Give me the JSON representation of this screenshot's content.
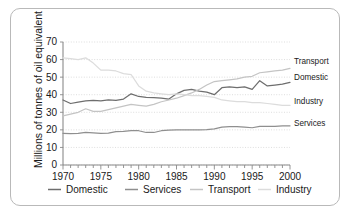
{
  "chart_data": {
    "type": "line",
    "title": "",
    "xlabel": "",
    "ylabel": "Millions of tonnes of oil equivalent",
    "xlim": [
      1970,
      2000
    ],
    "ylim": [
      0,
      70
    ],
    "grid": true,
    "legend_position": "bottom",
    "y_ticks": [
      "0",
      "10",
      "20",
      "30",
      "40",
      "50",
      "60",
      "70"
    ],
    "x_ticks_major": [
      "1970",
      "1975",
      "1980",
      "1985",
      "1990",
      "1995",
      "2000"
    ],
    "x_tick_interval_minor": 1,
    "x": [
      1970,
      1971,
      1972,
      1973,
      1974,
      1975,
      1976,
      1977,
      1978,
      1979,
      1980,
      1981,
      1982,
      1983,
      1984,
      1985,
      1986,
      1987,
      1988,
      1989,
      1990,
      1991,
      1992,
      1993,
      1994,
      1995,
      1996,
      1997,
      1998,
      1999,
      2000
    ],
    "series": [
      {
        "name": "Domestic",
        "color": "#6e6e6e",
        "end_label": "Domestic",
        "values": [
          37.0,
          35.0,
          35.8,
          36.5,
          36.8,
          36.5,
          37.0,
          36.8,
          37.5,
          40.5,
          39.0,
          38.5,
          38.3,
          38.0,
          37.5,
          40.5,
          42.5,
          43.0,
          42.0,
          41.5,
          40.0,
          44.0,
          44.5,
          44.0,
          44.5,
          43.0,
          48.0,
          45.0,
          45.5,
          46.0,
          47.0
        ]
      },
      {
        "name": "Services",
        "color": "#8f8f8f",
        "end_label": "Services",
        "values": [
          18.0,
          17.8,
          18.0,
          18.5,
          18.3,
          18.0,
          18.2,
          19.0,
          19.2,
          19.5,
          19.5,
          18.5,
          18.5,
          19.5,
          19.8,
          20.0,
          20.0,
          20.0,
          20.0,
          20.2,
          20.5,
          21.5,
          21.8,
          21.8,
          21.5,
          21.2,
          22.0,
          22.0,
          22.0,
          22.2,
          22.3
        ]
      },
      {
        "name": "Transport",
        "color": "#c4c4c4",
        "end_label": "Transport",
        "values": [
          28.0,
          29.0,
          30.0,
          32.0,
          30.5,
          30.5,
          31.5,
          32.5,
          33.5,
          34.5,
          34.0,
          33.5,
          34.5,
          36.0,
          37.0,
          38.0,
          39.5,
          41.0,
          43.0,
          45.5,
          47.5,
          48.0,
          48.5,
          49.0,
          50.0,
          50.5,
          52.5,
          53.0,
          53.5,
          54.0,
          55.0
        ]
      },
      {
        "name": "Industry",
        "color": "#dcdcdc",
        "end_label": "Industry",
        "values": [
          61.0,
          60.5,
          60.0,
          61.0,
          58.0,
          54.0,
          54.0,
          53.5,
          52.0,
          51.5,
          45.0,
          42.0,
          41.0,
          40.5,
          40.0,
          40.5,
          40.0,
          39.5,
          39.5,
          39.0,
          38.5,
          37.0,
          36.5,
          36.0,
          36.0,
          35.5,
          35.5,
          35.0,
          34.5,
          34.0,
          34.0
        ]
      }
    ],
    "legend": [
      {
        "label": "Domestic",
        "color": "#6e6e6e"
      },
      {
        "label": "Services",
        "color": "#8f8f8f"
      },
      {
        "label": "Transport",
        "color": "#c4c4c4"
      },
      {
        "label": "Industry",
        "color": "#dcdcdc"
      }
    ]
  }
}
